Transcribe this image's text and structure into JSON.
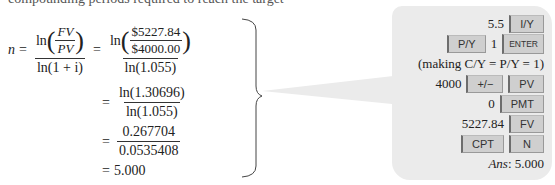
{
  "clipped_text": "compounding periods required to reach the target",
  "equation": {
    "lhs": "n",
    "step1": {
      "ln": "ln",
      "fv": "FV",
      "pv": "PV",
      "den": "ln(1 + i)"
    },
    "step2": {
      "ln": "ln",
      "num": "$5227.84",
      "den_inner": "$4000.00",
      "den": "ln(1.055)"
    },
    "step3": {
      "num": "ln(1.30696)",
      "den": "ln(1.055)"
    },
    "step4": {
      "num": "0.267704",
      "den": "0.0535408"
    },
    "result": "5.000",
    "equals": "="
  },
  "calculator": {
    "rows": [
      {
        "value": "5.5",
        "keys": [
          "I/Y"
        ]
      },
      {
        "pre_key": "P/Y",
        "value": "1",
        "keys": [
          "ENTER"
        ]
      },
      {
        "note": "(making C/Y = P/Y = 1)"
      },
      {
        "value": "4000",
        "keys": [
          "+/−",
          "PV"
        ]
      },
      {
        "value": "0",
        "keys": [
          "PMT"
        ]
      },
      {
        "value": "5227.84",
        "keys": [
          "FV"
        ]
      },
      {
        "keys": [
          "CPT",
          "N"
        ]
      }
    ],
    "answer_label": "Ans",
    "answer_value": ": 5.000"
  },
  "colors": {
    "callout_bg": "#ebebeb",
    "key_bg": "#cfcfcf"
  }
}
